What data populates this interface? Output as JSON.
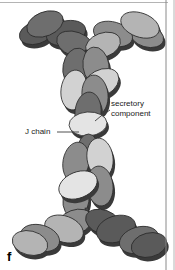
{
  "figure": {
    "panel_letter": "f",
    "background_color": "#ffffff",
    "width": 175,
    "height": 270,
    "border_right_color": "#8a8a8a",
    "border_top_color": "#b4b4b4"
  },
  "labels": {
    "secretory_component": {
      "line1": "secretory",
      "line2": "component",
      "text_color": "#1a1a1a"
    },
    "j_chain": {
      "text": "J chain",
      "text_color": "#1a1a1a"
    }
  },
  "leader_lines": {
    "color": "#3c3c3c",
    "secretory_component_from_x": 110,
    "secretory_component_from_y": 110,
    "secretory_component_to_x": 95,
    "secretory_component_to_y": 121,
    "j_chain_from_x": 57,
    "j_chain_from_y": 132,
    "j_chain_to_x": 79,
    "j_chain_to_y": 132
  },
  "palette": {
    "dark_gray": "#5a5a5a",
    "mid_dark_gray": "#6e6e6e",
    "mid_gray": "#8c8c8c",
    "light_gray": "#b4b4b4",
    "pale_gray": "#d2d2d2",
    "very_pale": "#e4e4e4",
    "outline": "#2b2b2b",
    "shadow": "#3a3a3a",
    "hinge_bar": "#4a4a4a"
  },
  "structure": {
    "description": "dimeric secretory IgA: two Y-shaped monomers joined tail-to-tail",
    "top_arm_left_domains": 4,
    "top_arm_right_domains": 4,
    "bottom_arm_left_domains": 4,
    "bottom_arm_right_domains": 4,
    "core_domains": 12
  },
  "ellipses": [
    {
      "name": "top-left-arm-d1",
      "cx": 45,
      "cy": 24,
      "rx": 19,
      "ry": 12,
      "rot": -22,
      "fill": "#6e6e6e"
    },
    {
      "name": "top-left-arm-d2",
      "cx": 36,
      "cy": 33,
      "rx": 17,
      "ry": 11,
      "rot": -16,
      "fill": "#5a5a5a"
    },
    {
      "name": "top-left-arm-d3",
      "cx": 66,
      "cy": 33,
      "rx": 20,
      "ry": 12,
      "rot": -14,
      "fill": "#5a5a5a"
    },
    {
      "name": "top-left-arm-d4",
      "cx": 75,
      "cy": 44,
      "rx": 19,
      "ry": 12,
      "rot": 20,
      "fill": "#6e6e6e"
    },
    {
      "name": "top-right-arm-d1",
      "cx": 140,
      "cy": 25,
      "rx": 20,
      "ry": 12,
      "rot": 20,
      "fill": "#b4b4b4"
    },
    {
      "name": "top-right-arm-d2",
      "cx": 147,
      "cy": 36,
      "rx": 17,
      "ry": 11,
      "rot": 16,
      "fill": "#8c8c8c"
    },
    {
      "name": "top-right-arm-d3",
      "cx": 113,
      "cy": 34,
      "rx": 20,
      "ry": 12,
      "rot": 16,
      "fill": "#8c8c8c"
    },
    {
      "name": "top-right-arm-d4",
      "cx": 103,
      "cy": 45,
      "rx": 18,
      "ry": 12,
      "rot": -20,
      "fill": "#b4b4b4"
    },
    {
      "name": "core-upper-1",
      "cx": 76,
      "cy": 67,
      "rx": 13,
      "ry": 19,
      "rot": 10,
      "fill": "#6e6e6e"
    },
    {
      "name": "core-upper-2",
      "cx": 96,
      "cy": 66,
      "rx": 13,
      "ry": 19,
      "rot": -8,
      "fill": "#8c8c8c"
    },
    {
      "name": "core-upper-3",
      "cx": 101,
      "cy": 83,
      "rx": 19,
      "ry": 13,
      "rot": -28,
      "fill": "#d2d2d2"
    },
    {
      "name": "core-upper-4",
      "cx": 74,
      "cy": 90,
      "rx": 13,
      "ry": 20,
      "rot": 8,
      "fill": "#d2d2d2"
    },
    {
      "name": "core-upper-5",
      "cx": 95,
      "cy": 95,
      "rx": 13,
      "ry": 20,
      "rot": -6,
      "fill": "#8c8c8c"
    },
    {
      "name": "core-upper-6",
      "cx": 88,
      "cy": 112,
      "rx": 13,
      "ry": 20,
      "rot": 6,
      "fill": "#6e6e6e"
    },
    {
      "name": "secretory-component-ellipse",
      "cx": 88,
      "cy": 124,
      "rx": 19,
      "ry": 12,
      "rot": -4,
      "fill": "#e4e4e4"
    },
    {
      "name": "core-lower-1",
      "cx": 76,
      "cy": 162,
      "rx": 13,
      "ry": 20,
      "rot": 10,
      "fill": "#8c8c8c"
    },
    {
      "name": "core-lower-2",
      "cx": 100,
      "cy": 158,
      "rx": 13,
      "ry": 20,
      "rot": -8,
      "fill": "#d2d2d2"
    },
    {
      "name": "core-lower-3",
      "cx": 88,
      "cy": 152,
      "rx": 11,
      "ry": 18,
      "rot": 2,
      "fill": "#6e6e6e"
    },
    {
      "name": "core-lower-4",
      "cx": 78,
      "cy": 185,
      "rx": 20,
      "ry": 13,
      "rot": -22,
      "fill": "#e4e4e4"
    },
    {
      "name": "core-lower-5",
      "cx": 100,
      "cy": 186,
      "rx": 13,
      "ry": 20,
      "rot": -6,
      "fill": "#8c8c8c"
    },
    {
      "name": "core-lower-6",
      "cx": 76,
      "cy": 200,
      "rx": 13,
      "ry": 18,
      "rot": 8,
      "fill": "#8c8c8c"
    },
    {
      "name": "bottom-left-arm-d1",
      "cx": 75,
      "cy": 222,
      "rx": 18,
      "ry": 12,
      "rot": -20,
      "fill": "#8c8c8c"
    },
    {
      "name": "bottom-left-arm-d2",
      "cx": 64,
      "cy": 229,
      "rx": 20,
      "ry": 13,
      "rot": 20,
      "fill": "#b4b4b4"
    },
    {
      "name": "bottom-left-arm-d3",
      "cx": 40,
      "cy": 238,
      "rx": 20,
      "ry": 13,
      "rot": 16,
      "fill": "#8c8c8c"
    },
    {
      "name": "bottom-left-arm-d4",
      "cx": 30,
      "cy": 243,
      "rx": 18,
      "ry": 12,
      "rot": 14,
      "fill": "#b4b4b4"
    },
    {
      "name": "bottom-right-arm-d1",
      "cx": 103,
      "cy": 222,
      "rx": 18,
      "ry": 12,
      "rot": 20,
      "fill": "#5a5a5a"
    },
    {
      "name": "bottom-right-arm-d2",
      "cx": 116,
      "cy": 229,
      "rx": 20,
      "ry": 13,
      "rot": -18,
      "fill": "#5a5a5a"
    },
    {
      "name": "bottom-right-arm-d3",
      "cx": 139,
      "cy": 240,
      "rx": 20,
      "ry": 13,
      "rot": -16,
      "fill": "#6e6e6e"
    },
    {
      "name": "bottom-right-arm-d4",
      "cx": 149,
      "cy": 245,
      "rx": 18,
      "ry": 12,
      "rot": -14,
      "fill": "#5a5a5a"
    }
  ]
}
